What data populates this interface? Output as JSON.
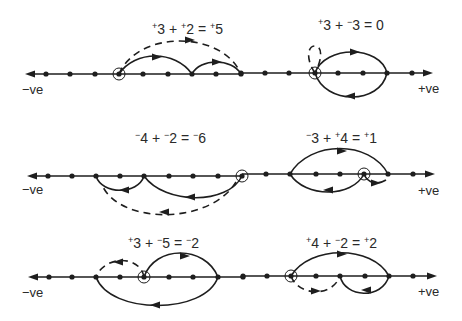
{
  "colors": {
    "ink": "#1e1e1e",
    "text": "#2a2a2a",
    "background": "#ffffff"
  },
  "axis_labels": {
    "negative": "−ve",
    "positive": "+ve"
  },
  "examples": [
    {
      "id": "p3-plus-p2",
      "equation": [
        {
          "sign": "+",
          "n": "3"
        },
        {
          "op": " + "
        },
        {
          "sign": "+",
          "n": "2"
        },
        {
          "op": " = "
        },
        {
          "sign": "+",
          "n": "5"
        }
      ],
      "equation_text": "+3 + +2 = +5",
      "eq_pos": [
        152,
        34
      ],
      "line": {
        "y": 74,
        "x1": 30,
        "x2": 242,
        "arrow_left": true,
        "arrow_right": false,
        "label": "negative",
        "label_pos": [
          22,
          94
        ]
      },
      "dots": [
        46,
        70,
        95,
        119,
        143,
        168,
        192,
        216,
        241
      ],
      "circled": [
        119
      ],
      "arcs": [
        {
          "d": "M119,74 C135,50 175,50 192,74",
          "dash": false,
          "arrow": [
            157,
            57,
            "right"
          ]
        },
        {
          "d": "M192,74 C200,58 232,58 241,74",
          "dash": false,
          "arrow": [
            217,
            62,
            "right"
          ]
        },
        {
          "d": "M119,74 C138,30 222,30 241,74",
          "dash": true,
          "arrow": [
            190,
            40,
            "right"
          ]
        }
      ]
    },
    {
      "id": "p3-plus-m3",
      "equation": [
        {
          "sign": "+",
          "n": "3"
        },
        {
          "op": " + "
        },
        {
          "sign": "−",
          "n": "3"
        },
        {
          "op": " = "
        },
        {
          "sign": "",
          "n": "0"
        }
      ],
      "equation_text": "+3 + −3 = 0",
      "eq_pos": [
        318,
        30
      ],
      "line": {
        "y": 73,
        "x1": 241,
        "x2": 428,
        "arrow_left": false,
        "arrow_right": true,
        "label": "positive",
        "label_pos": [
          418,
          93
        ]
      },
      "dots": [
        241,
        265,
        289,
        315,
        338,
        363,
        387,
        412
      ],
      "circled": [
        315
      ],
      "arcs": [
        {
          "d": "M315,73 C325,45 380,45 387,73",
          "dash": false,
          "arrow": [
            355,
            52,
            "right"
          ]
        },
        {
          "d": "M387,73 C380,105 325,105 315,73",
          "dash": false,
          "arrow": [
            350,
            96,
            "left"
          ]
        },
        {
          "d": "M315,73 C306,60 307,46 315,46 C323,46 322,60 315,73",
          "dash": true,
          "arrow": null
        }
      ]
    },
    {
      "id": "m4-plus-m2",
      "equation": [
        {
          "sign": "−",
          "n": "4"
        },
        {
          "op": " + "
        },
        {
          "sign": "−",
          "n": "2"
        },
        {
          "op": " = "
        },
        {
          "sign": "−",
          "n": "6"
        }
      ],
      "equation_text": "−4 + −2 = −6",
      "eq_pos": [
        135,
        143
      ],
      "line": {
        "y": 176,
        "x1": 32,
        "x2": 244,
        "arrow_left": true,
        "arrow_right": false,
        "label": "negative",
        "label_pos": [
          22,
          194
        ]
      },
      "dots": [
        48,
        72,
        96,
        120,
        144,
        169,
        193,
        218,
        242
      ],
      "circled": [
        242
      ],
      "arcs": [
        {
          "d": "M242,176 C228,205 165,205 144,176",
          "dash": false,
          "arrow": [
            190,
            197,
            "left"
          ]
        },
        {
          "d": "M144,176 C138,195 102,195 96,176",
          "dash": false,
          "arrow": [
            124,
            190,
            "left"
          ]
        },
        {
          "d": "M236,182 C210,225 120,225 102,185",
          "dash": true,
          "arrow": [
            164,
            212,
            "left"
          ]
        }
      ]
    },
    {
      "id": "m3-plus-p4",
      "equation": [
        {
          "sign": "−",
          "n": "3"
        },
        {
          "op": " + "
        },
        {
          "sign": "+",
          "n": "4"
        },
        {
          "op": " = "
        },
        {
          "sign": "+",
          "n": "1"
        }
      ],
      "equation_text": "−3 + +4 = +1",
      "eq_pos": [
        306,
        143
      ],
      "line": {
        "y": 174,
        "x1": 242,
        "x2": 430,
        "arrow_left": false,
        "arrow_right": true,
        "label": "positive",
        "label_pos": [
          418,
          195
        ]
      },
      "dots": [
        266,
        290,
        316,
        340,
        364,
        388,
        413
      ],
      "circled": [
        364
      ],
      "arcs": [
        {
          "d": "M290,174 C310,140 370,140 388,174",
          "dash": false,
          "arrow": [
            342,
            151,
            "right"
          ]
        },
        {
          "d": "M364,174 C352,198 305,198 290,174",
          "dash": false,
          "arrow": [
            328,
            190,
            "left"
          ]
        },
        {
          "d": "M364,174 C368,184 378,185 386,180",
          "dash": false,
          "arrow": [
            376,
            183,
            "right"
          ]
        }
      ]
    },
    {
      "id": "p3-plus-m5",
      "equation": [
        {
          "sign": "+",
          "n": "3"
        },
        {
          "op": " + "
        },
        {
          "sign": "−",
          "n": "5"
        },
        {
          "op": " = "
        },
        {
          "sign": "−",
          "n": "2"
        }
      ],
      "equation_text": "+3 + −5 = −2",
      "eq_pos": [
        128,
        248
      ],
      "line": {
        "y": 277,
        "x1": 33,
        "x2": 243,
        "arrow_left": true,
        "arrow_right": false,
        "label": "negative",
        "label_pos": [
          22,
          297
        ]
      },
      "dots": [
        49,
        72,
        96,
        120,
        144,
        169,
        193,
        218,
        243
      ],
      "circled": [
        144
      ],
      "arcs": [
        {
          "d": "M144,277 C155,245 205,245 218,277",
          "dash": false,
          "arrow": [
            185,
            256,
            "right"
          ]
        },
        {
          "d": "M218,277 C205,315 110,315 96,277",
          "dash": false,
          "arrow": [
            155,
            305,
            "left"
          ]
        },
        {
          "d": "M144,277 C140,255 105,255 96,277",
          "dash": true,
          "arrow": [
            118,
            262,
            "left"
          ]
        }
      ]
    },
    {
      "id": "p4-plus-m2",
      "equation": [
        {
          "sign": "+",
          "n": "4"
        },
        {
          "op": " + "
        },
        {
          "sign": "−",
          "n": "2"
        },
        {
          "op": " = "
        },
        {
          "sign": "+",
          "n": "2"
        }
      ],
      "equation_text": "+4 + −2 = +2",
      "eq_pos": [
        306,
        248
      ],
      "line": {
        "y": 276,
        "x1": 243,
        "x2": 432,
        "arrow_left": false,
        "arrow_right": true,
        "label": "positive",
        "label_pos": [
          418,
          296
        ]
      },
      "dots": [
        243,
        267,
        291,
        316,
        340,
        365,
        389,
        413
      ],
      "circled": [
        291
      ],
      "arcs": [
        {
          "d": "M291,276 C310,245 372,245 389,276",
          "dash": false,
          "arrow": [
            342,
            254,
            "right"
          ]
        },
        {
          "d": "M389,276 C382,300 345,298 340,276",
          "dash": false,
          "arrow": [
            366,
            290,
            "left"
          ]
        },
        {
          "d": "M291,276 C298,296 332,298 340,276",
          "dash": true,
          "arrow": [
            316,
            291,
            "right"
          ]
        }
      ]
    }
  ]
}
